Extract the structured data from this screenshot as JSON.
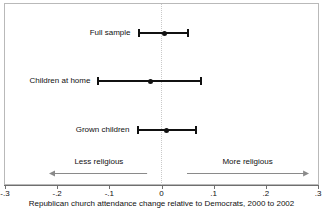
{
  "chart_data": {
    "type": "scatter",
    "title": "",
    "subtitle": "",
    "xlabel": "Republican church attendance change relative to Democrats, 2000 to 2002",
    "ylabel": "",
    "xlim": [
      -0.3,
      0.3
    ],
    "xticks": [
      -0.3,
      -0.2,
      -0.1,
      0,
      0.1,
      0.2,
      0.3
    ],
    "xtick_labels": [
      "-.3",
      "-.2",
      "-.1",
      "0",
      ".1",
      ".2",
      ".3"
    ],
    "grid": false,
    "legend": "none",
    "reference_line": {
      "x": 0,
      "style": "dotted",
      "color": "#c9c9c9"
    },
    "categories": [
      "Full sample",
      "Children at home",
      "Grown children"
    ],
    "series": [
      {
        "name": "Republican church attendance change relative to Democrats",
        "points": [
          {
            "category": "Full sample",
            "estimate": 0.005,
            "ci_low": -0.044,
            "ci_high": 0.051
          },
          {
            "category": "Children at home",
            "estimate": -0.021,
            "ci_low": -0.121,
            "ci_high": 0.076
          },
          {
            "category": "Grown children",
            "estimate": 0.009,
            "ci_low": -0.046,
            "ci_high": 0.066
          }
        ]
      }
    ],
    "annotations": [
      {
        "text": "Less religious",
        "direction": "left",
        "from": -0.215,
        "to": -0.025
      },
      {
        "text": "More religious",
        "direction": "right",
        "from": 0.047,
        "to": 0.283
      }
    ],
    "colors": {
      "marker": "#111111",
      "error_bar": "#111111",
      "frame": "#b9b9b9",
      "axis": "#6f6f6f",
      "annotation_arrow": "#8a8a8a",
      "background": "#ffffff"
    }
  },
  "rows": [
    {
      "label": "Full sample"
    },
    {
      "label": "Children at home"
    },
    {
      "label": "Grown children"
    }
  ],
  "annotations": [
    {
      "label": "Less religious"
    },
    {
      "label": "More religious"
    }
  ],
  "axis": {
    "caption": "Republican church attendance change relative to Democrats, 2000 to 2002",
    "ticks": [
      "-.3",
      "-.2",
      "-.1",
      "0",
      ".1",
      ".2",
      ".3"
    ]
  }
}
